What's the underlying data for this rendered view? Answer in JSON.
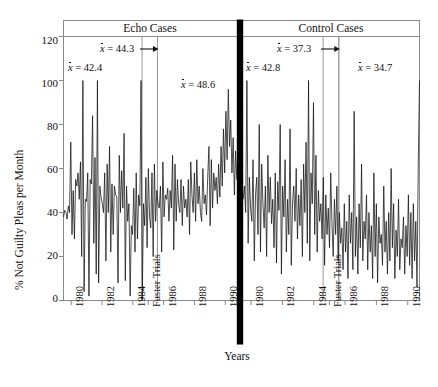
{
  "chart_data": {
    "type": "line",
    "title": "",
    "xlabel": "Years",
    "ylabel": "% Not Guilty Pleas per Month",
    "ylim": [
      0,
      120
    ],
    "yticks": [
      0,
      20,
      40,
      60,
      80,
      100,
      120
    ],
    "grid": false,
    "legend_position": "none",
    "panels": [
      {
        "name": "echo",
        "title": "Echo Cases",
        "xticks": [
          "1980",
          "1982",
          "1984",
          "Fuster Trials",
          "1986",
          "1988",
          "1990"
        ],
        "xtick_years": [
          1980,
          1982,
          1984,
          1985.0,
          1986,
          1988,
          1990
        ],
        "segments": [
          {
            "label": "x̄ = 42.4",
            "mean": 42.4,
            "start_year": 1979.5,
            "end_year": 1984.6,
            "arrow": false
          },
          {
            "label": "x̄ = 44.3",
            "mean": 44.3,
            "start_year": 1984.6,
            "end_year": 1985.6,
            "arrow": true
          },
          {
            "label": "x̄ = 48.6",
            "mean": 48.6,
            "start_year": 1985.6,
            "end_year": 1990.6,
            "arrow": false
          }
        ],
        "values": [
          38,
          41,
          40,
          37,
          43,
          40,
          72,
          30,
          50,
          28,
          55,
          52,
          58,
          46,
          63,
          20,
          100,
          4,
          46,
          45,
          58,
          2,
          55,
          53,
          84,
          26,
          65,
          12,
          100,
          8,
          52,
          47,
          44,
          40,
          58,
          18,
          62,
          40,
          70,
          22,
          53,
          30,
          52,
          48,
          47,
          8,
          66,
          40,
          59,
          42,
          76,
          9,
          52,
          36,
          44,
          2,
          34,
          30,
          51,
          22,
          58,
          28,
          48,
          43,
          100,
          0,
          44,
          34,
          56,
          24,
          60,
          38,
          33,
          58,
          20,
          62,
          36,
          50,
          44,
          42,
          52,
          22,
          63,
          38,
          48,
          46,
          51,
          36,
          50,
          42,
          66,
          23,
          62,
          36,
          55,
          44,
          40,
          55,
          34,
          52,
          42,
          46,
          38,
          55,
          30,
          63,
          48,
          40,
          58,
          36,
          64,
          44,
          52,
          40,
          36,
          60,
          44,
          48,
          39,
          56,
          70,
          34,
          64,
          42,
          58,
          50,
          56,
          44,
          62,
          47,
          70,
          52,
          78,
          58,
          86,
          64,
          96,
          70,
          82,
          58,
          74,
          48,
          68,
          55
        ]
      },
      {
        "name": "control",
        "title": "Control Cases",
        "xticks": [
          "1980",
          "1982",
          "1984",
          "Fuster Trials",
          "1986",
          "1988",
          "1990"
        ],
        "xtick_years": [
          1980,
          1982,
          1984,
          1985.0,
          1986,
          1988,
          1990
        ],
        "segments": [
          {
            "label": "x̄ = 42.8",
            "mean": 42.8,
            "start_year": 1979.5,
            "end_year": 1984.6,
            "arrow": false
          },
          {
            "label": "x̄ = 37.3",
            "mean": 37.3,
            "start_year": 1984.6,
            "end_year": 1985.6,
            "arrow": true
          },
          {
            "label": "x̄ = 34.7",
            "mean": 34.7,
            "start_year": 1985.6,
            "end_year": 1990.6,
            "arrow": false
          }
        ],
        "values": [
          46,
          52,
          40,
          100,
          26,
          56,
          42,
          36,
          64,
          18,
          48,
          56,
          30,
          80,
          22,
          62,
          44,
          33,
          52,
          20,
          66,
          40,
          56,
          35,
          46,
          24,
          58,
          17,
          54,
          41,
          80,
          12,
          52,
          38,
          64,
          22,
          46,
          30,
          78,
          16,
          44,
          52,
          36,
          60,
          28,
          48,
          34,
          55,
          20,
          62,
          40,
          72,
          26,
          100,
          18,
          58,
          44,
          90,
          30,
          66,
          22,
          50,
          36,
          44,
          28,
          56,
          16,
          48,
          30,
          42,
          24,
          58,
          35,
          20,
          46,
          30,
          52,
          18,
          40,
          26,
          33,
          14,
          44,
          22,
          36,
          10,
          48,
          26,
          40,
          14,
          86,
          20,
          38,
          12,
          44,
          24,
          62,
          18,
          36,
          28,
          48,
          14,
          40,
          22,
          34,
          10,
          58,
          20,
          44,
          8,
          38,
          26,
          30,
          16,
          52,
          22,
          36,
          12,
          40,
          18,
          60,
          24,
          44,
          10,
          32,
          20,
          46,
          14,
          28,
          24,
          38,
          12,
          34,
          20,
          48,
          16,
          40,
          10,
          44,
          18,
          36,
          6,
          62,
          100
        ]
      }
    ]
  },
  "axes": {
    "y_title": "% Not Guilty Pleas per Month",
    "x_title": "Years",
    "y_tick_labels": [
      "120",
      "100",
      "80",
      "60",
      "40",
      "20",
      "0"
    ]
  },
  "panel_titles": {
    "left": "Echo Cases",
    "right": "Control Cases"
  },
  "annotations": {
    "echo_1": "x̄ = 42.4",
    "echo_2": "x̄ = 44.3",
    "echo_3": "x̄ = 48.6",
    "control_1": "x̄ = 42.8",
    "control_2": "x̄ = 37.3",
    "control_3": "x̄ = 34.7"
  },
  "colors": {
    "line": "#111111",
    "frame": "#8a8a8a",
    "divider": "#9a9a9a",
    "center_bar": "#000000",
    "text": "#111111",
    "background": "#ffffff"
  }
}
